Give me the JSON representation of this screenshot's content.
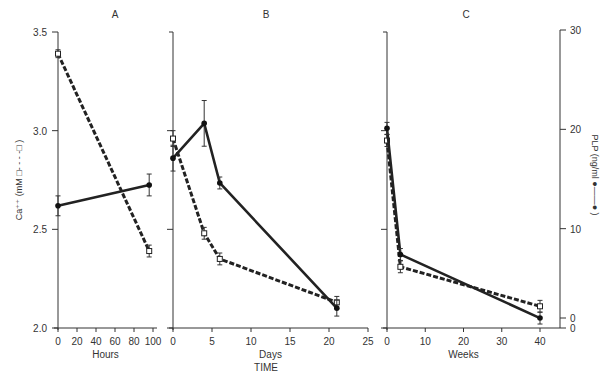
{
  "chart_data": [
    {
      "type": "line",
      "panel": "A",
      "title": "A",
      "xlabel": "Hours",
      "x_ticks": [
        0,
        20,
        40,
        60,
        80,
        100
      ],
      "xlim": [
        0,
        100
      ],
      "series": [
        {
          "name": "Ca++ (mM) — dashed, open squares",
          "axis": "left",
          "x": [
            0,
            96
          ],
          "values": [
            3.39,
            2.39
          ],
          "errors": [
            0.02,
            0.03
          ]
        },
        {
          "name": "PLP (ng/ml) — solid, filled circles",
          "axis": "right",
          "x": [
            0,
            96
          ],
          "values": [
            12.3,
            14.4
          ],
          "errors": [
            1.0,
            1.1
          ]
        }
      ]
    },
    {
      "type": "line",
      "panel": "B",
      "title": "B",
      "xlabel": "Days",
      "x_ticks": [
        0,
        5,
        10,
        15,
        20,
        25
      ],
      "xlim": [
        0,
        25
      ],
      "series": [
        {
          "name": "Ca++ (mM) — dashed, open squares",
          "axis": "left",
          "x": [
            0,
            4,
            6,
            21
          ],
          "values": [
            2.96,
            2.48,
            2.35,
            2.13
          ],
          "errors": [
            0.04,
            0.03,
            0.03,
            0.03
          ]
        },
        {
          "name": "PLP (ng/ml) — solid, filled circles",
          "axis": "right",
          "x": [
            0,
            4,
            6,
            21
          ],
          "values": [
            17.1,
            20.6,
            14.6,
            2.0
          ],
          "errors": [
            1.3,
            2.3,
            0.6,
            0.8
          ]
        }
      ]
    },
    {
      "type": "line",
      "panel": "C",
      "title": "C",
      "xlabel": "Weeks",
      "x_ticks": [
        0,
        10,
        20,
        30,
        40
      ],
      "xlim": [
        0,
        45
      ],
      "series": [
        {
          "name": "Ca++ (mM) — dashed, open squares",
          "axis": "left",
          "x": [
            0,
            3.5,
            40
          ],
          "values": [
            2.95,
            2.31,
            2.11
          ],
          "errors": [
            0.03,
            0.03,
            0.03
          ]
        },
        {
          "name": "PLP (ng/ml) — solid, filled circles",
          "axis": "right",
          "x": [
            0,
            3.5,
            40
          ],
          "values": [
            20.1,
            7.4,
            1.0
          ],
          "errors": [
            0.6,
            0.6,
            0.6
          ]
        }
      ]
    }
  ],
  "axes": {
    "left": {
      "label": "Ca⁺⁺ (mM",
      "legend_symbol": "□- - - -□ )",
      "ticks": [
        "3.5",
        "3.0",
        "2.5",
        "2.0"
      ],
      "range": [
        2.0,
        3.5
      ]
    },
    "right": {
      "label": "PLP (ng/ml",
      "legend_symbol": "●——● )",
      "ticks": [
        "30",
        "20",
        "10",
        "0",
        "0"
      ],
      "range": [
        0,
        30
      ]
    },
    "shared_xlabel": "TIME"
  },
  "panels": {
    "A": {
      "title": "A",
      "xlabel": "Hours",
      "ticks": [
        "0",
        "20",
        "40",
        "60",
        "80",
        "100"
      ]
    },
    "B": {
      "title": "B",
      "xlabel": "Days",
      "ticks": [
        "0",
        "5",
        "10",
        "15",
        "20",
        "25"
      ]
    },
    "C": {
      "title": "C",
      "xlabel": "Weeks",
      "ticks": [
        "0",
        "10",
        "20",
        "30",
        "40"
      ]
    }
  },
  "colors": {
    "ink": "#222222",
    "background": "#ffffff"
  }
}
